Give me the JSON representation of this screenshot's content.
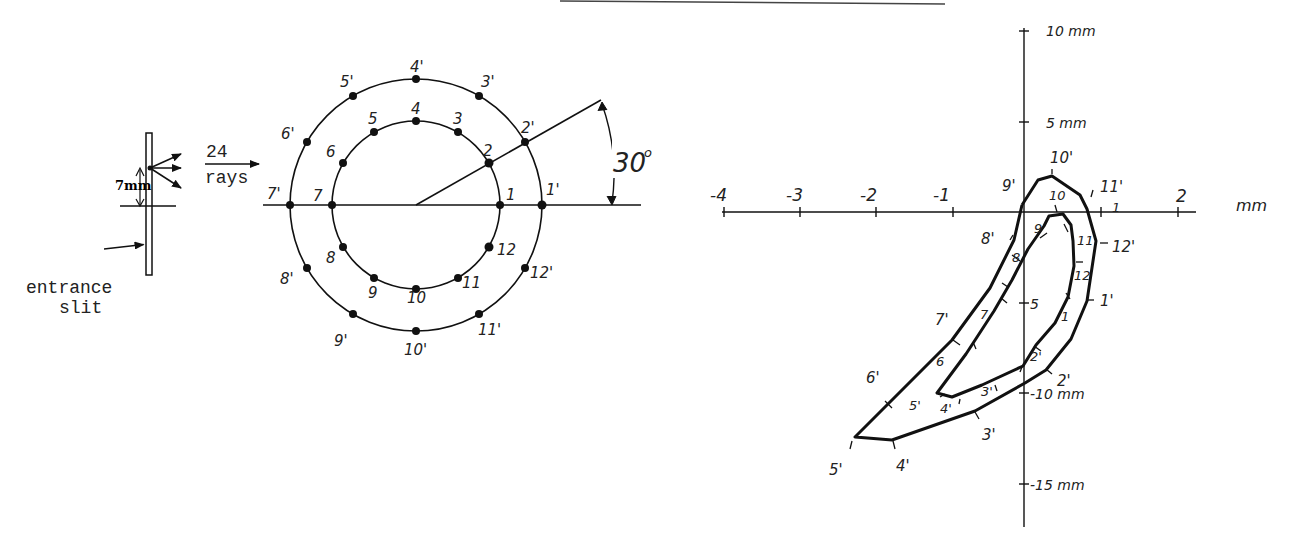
{
  "scan_artifact_line": {
    "x1": 560,
    "y1": 0,
    "x2": 945,
    "y2": 4
  },
  "slit": {
    "label_line1": "entrance",
    "label_line2": "slit",
    "dimension_label": "7mm",
    "rays_count": "24",
    "rays_word": "rays"
  },
  "ray_pattern": {
    "center": [
      416,
      205
    ],
    "inner_radius": 84,
    "outer_radius": 126,
    "angle_label": "30°",
    "angle_number": "30",
    "angle_degree_mark": "o",
    "inner_points": [
      "1",
      "2",
      "3",
      "4",
      "5",
      "6",
      "7",
      "8",
      "9",
      "10",
      "11",
      "12"
    ],
    "outer_points": [
      "1'",
      "2'",
      "3'",
      "4'",
      "5'",
      "6'",
      "7'",
      "8'",
      "9'",
      "10'",
      "11'",
      "12'"
    ]
  },
  "spot_plot": {
    "x_axis": {
      "unit_label": "mm",
      "ticks": [
        {
          "label": "-4",
          "x": 724
        },
        {
          "label": "-3",
          "x": 800
        },
        {
          "label": "-2",
          "x": 876
        },
        {
          "label": "-1",
          "x": 953
        },
        {
          "label": "1",
          "x": 1101
        },
        {
          "label": "2",
          "x": 1178
        }
      ]
    },
    "y_axis": {
      "ticks": [
        {
          "label": "10 mm",
          "y": 31
        },
        {
          "label": "5 mm",
          "y": 122
        },
        {
          "label": "-10 mm",
          "y": 393
        },
        {
          "label": "-15 mm",
          "y": 484
        }
      ],
      "inner_5_label": "5"
    },
    "outer_curve_labels": [
      "1'",
      "2'",
      "3'",
      "4'",
      "5'",
      "6'",
      "7'",
      "8'",
      "9'",
      "10'",
      "11'",
      "12'"
    ],
    "inner_curve_labels": [
      "1",
      "2'",
      "3'",
      "4'",
      "5'",
      "6",
      "7",
      "8",
      "9",
      "10",
      "11",
      "12"
    ]
  }
}
